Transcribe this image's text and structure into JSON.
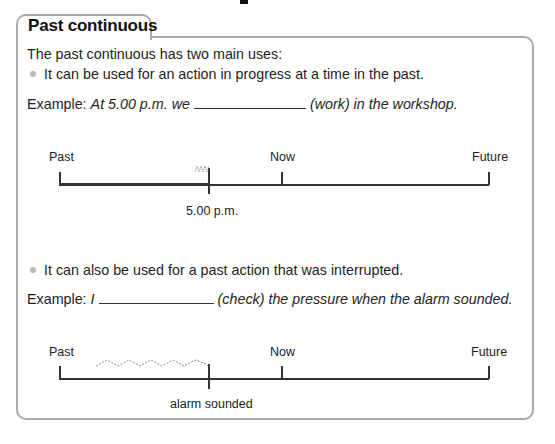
{
  "tab": {
    "title": "Past continuous"
  },
  "intro": "The past continuous has two main uses:",
  "uses": [
    {
      "bullet": "It can be used for an action in progress at a time in the past.",
      "example_label": "Example:",
      "example_before": "At 5.00 p.m. we",
      "example_after": "(work) in the workshop.",
      "timeline": {
        "past": "Past",
        "now": "Now",
        "future": "Future",
        "marker": "5.00 p.m."
      }
    },
    {
      "bullet": "It can also be used for a past action that was interrupted.",
      "example_label": "Example:",
      "example_before": "I",
      "example_after": "(check) the pressure when the alarm sounded.",
      "timeline": {
        "past": "Past",
        "now": "Now",
        "future": "Future",
        "marker": "alarm sounded"
      }
    }
  ]
}
